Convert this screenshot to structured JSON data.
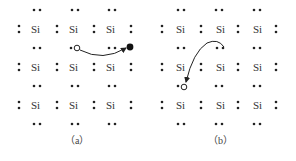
{
  "diagram": {
    "element_label": "Si",
    "colors": {
      "ink": "#222222",
      "text": "#333333",
      "background": "#ffffff"
    },
    "panels": [
      {
        "id": "a",
        "caption": "（a）",
        "description": "Electron from covalent bond breaks free leaving a hole; free electron moves to the right",
        "hole_icon": "hollow-circle",
        "electron_icon": "filled-circle",
        "arrow_direction": "from hole toward free electron"
      },
      {
        "id": "b",
        "caption": "（b）",
        "description": "Valence electron from a neighboring bond moves to fill the hole",
        "hole_icon": "hollow-circle",
        "arrow_direction": "from bond electron down-left into hole"
      }
    ],
    "grid": {
      "rows": 3,
      "cols": 3
    }
  }
}
